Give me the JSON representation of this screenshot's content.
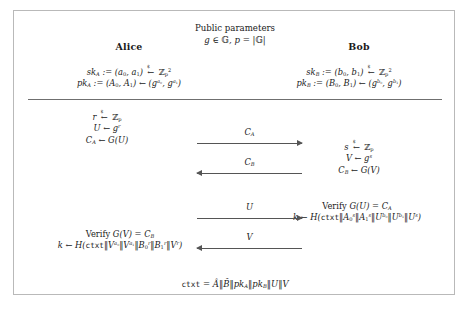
{
  "figure": {
    "header": {
      "title": "Public parameters",
      "parameters": "g ∈ 𝔾, p = |𝔾|"
    },
    "parties": {
      "left": {
        "name": "Alice",
        "secret_key": "sk_A := (a0, a1) ←$ Z_p^2",
        "public_key": "pk_A := (A0, A1) ← (g^a0, g^a1)"
      },
      "right": {
        "name": "Bob",
        "secret_key": "sk_B := (b0, b1) ←$ Z_p^2",
        "public_key": "pk_B := (B0, B1) ← (g^b0, g^b1)"
      }
    },
    "steps": {
      "alice_round1": {
        "line1": "r ←$ Z_p",
        "line2": "U ← g^r",
        "line3": "C_A ← G(U)"
      },
      "bob_round1": {
        "line1": "s ←$ Z_p",
        "line2": "V ← g^s",
        "line3": "C_B ← G(V)"
      },
      "bob_verify": {
        "line1": "Verify G(U) = C_A",
        "line2": "k ← H(ctxt‖A0^s‖A1^s‖U^b0‖U^b1‖U^s)"
      },
      "alice_verify": {
        "line1": "Verify G(V) = C_B",
        "line2": "k ← H(ctxt‖V^a0‖V^a1‖B0^r‖B1^r‖V^r)"
      }
    },
    "messages": [
      {
        "label": "C_A",
        "direction": "right"
      },
      {
        "label": "C_B",
        "direction": "left"
      },
      {
        "label": "U",
        "direction": "right"
      },
      {
        "label": "V",
        "direction": "left"
      }
    ],
    "context": "ctxt = Â‖B̂‖pk_A‖pk_B‖U‖V",
    "colors": {
      "border": "#b9b9b9",
      "separator": "#6f6f6f",
      "arrow": "#555555",
      "text": "#1a1a1a",
      "background": "#ffffff"
    }
  }
}
